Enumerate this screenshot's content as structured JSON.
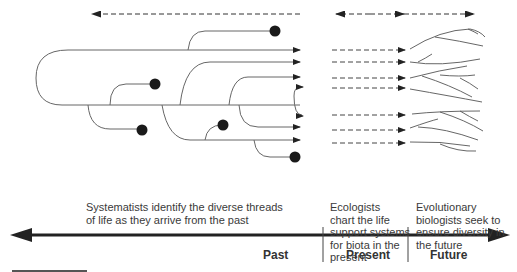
{
  "eras": [
    {
      "name": "Past"
    },
    {
      "name": "Present"
    },
    {
      "name": "Future"
    }
  ],
  "descriptions": {
    "past_line1": "Systematists identify the diverse threads",
    "past_line2": "of life as they arrive from the past",
    "present_lines": [
      "Ecologists",
      "chart the life",
      "support systems",
      "for biota in the",
      "present"
    ],
    "future_lines": [
      "Evolutionary",
      "biologists seek to",
      "ensure diversity in",
      "the future"
    ]
  },
  "colors": {
    "line": "#555555",
    "axis": "#222222",
    "node": "#1a1a1a"
  }
}
